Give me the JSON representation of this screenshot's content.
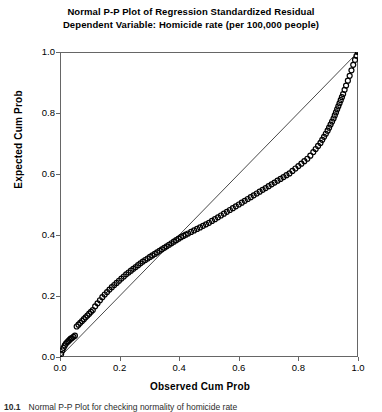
{
  "title": {
    "line1": "Normal P-P Plot of Regression Standardized Residual",
    "line2": "Dependent Variable: Homicide rate (per 100,000 people)"
  },
  "axes": {
    "xlabel": "Observed Cum Prob",
    "ylabel": "Expected Cum Prob",
    "xticks": [
      "0.0",
      "0.2",
      "0.4",
      "0.6",
      "0.8",
      "1.0"
    ],
    "yticks": [
      "0.0",
      "0.2",
      "0.4",
      "0.6",
      "0.8",
      "1.0"
    ]
  },
  "caption": {
    "number": "10.1",
    "text": "Normal P-P Plot for checking normality of homicide rate"
  },
  "colors": {
    "marker": "#000000",
    "reference_line": "#1a1a1a",
    "frame": "#666666",
    "background": "#ffffff"
  },
  "chart_data": {
    "type": "scatter",
    "title": "Normal P-P Plot of Regression Standardized Residual",
    "subtitle": "Dependent Variable: Homicide rate (per 100,000 people)",
    "xlabel": "Observed Cum Prob",
    "ylabel": "Expected Cum Prob",
    "xlim": [
      0.0,
      1.0
    ],
    "ylim": [
      0.0,
      1.0
    ],
    "grid": false,
    "legend": false,
    "marker_style": "open-circle",
    "reference_line": {
      "label": "45-degree reference line",
      "from": [
        0.0,
        0.0
      ],
      "to": [
        1.0,
        1.0
      ]
    },
    "series": [
      {
        "name": "Observed vs Expected cumulative probability",
        "x": [
          0.004,
          0.008,
          0.012,
          0.016,
          0.02,
          0.024,
          0.028,
          0.032,
          0.036,
          0.04,
          0.045,
          0.05,
          0.056,
          0.062,
          0.068,
          0.074,
          0.08,
          0.086,
          0.092,
          0.098,
          0.104,
          0.11,
          0.118,
          0.126,
          0.134,
          0.142,
          0.15,
          0.158,
          0.166,
          0.174,
          0.182,
          0.19,
          0.198,
          0.206,
          0.214,
          0.222,
          0.23,
          0.238,
          0.246,
          0.254,
          0.262,
          0.27,
          0.278,
          0.286,
          0.294,
          0.302,
          0.31,
          0.318,
          0.326,
          0.334,
          0.342,
          0.35,
          0.358,
          0.366,
          0.374,
          0.382,
          0.39,
          0.398,
          0.406,
          0.414,
          0.422,
          0.43,
          0.44,
          0.45,
          0.46,
          0.47,
          0.48,
          0.49,
          0.5,
          0.51,
          0.52,
          0.53,
          0.54,
          0.55,
          0.56,
          0.57,
          0.58,
          0.59,
          0.6,
          0.61,
          0.62,
          0.63,
          0.64,
          0.65,
          0.66,
          0.67,
          0.68,
          0.69,
          0.7,
          0.71,
          0.72,
          0.73,
          0.74,
          0.75,
          0.76,
          0.77,
          0.78,
          0.79,
          0.8,
          0.81,
          0.82,
          0.83,
          0.84,
          0.85,
          0.858,
          0.866,
          0.874,
          0.88,
          0.886,
          0.892,
          0.898,
          0.903,
          0.908,
          0.913,
          0.918,
          0.922,
          0.926,
          0.93,
          0.934,
          0.938,
          0.942,
          0.946,
          0.95,
          0.955,
          0.96,
          0.966,
          0.972,
          0.978,
          0.984,
          0.99,
          0.995,
          1.0
        ],
        "y": [
          0.01,
          0.022,
          0.03,
          0.038,
          0.044,
          0.048,
          0.052,
          0.056,
          0.06,
          0.062,
          0.066,
          0.07,
          0.1,
          0.106,
          0.112,
          0.118,
          0.124,
          0.13,
          0.136,
          0.142,
          0.148,
          0.154,
          0.166,
          0.176,
          0.186,
          0.196,
          0.205,
          0.213,
          0.221,
          0.229,
          0.236,
          0.243,
          0.25,
          0.257,
          0.264,
          0.271,
          0.277,
          0.283,
          0.289,
          0.295,
          0.301,
          0.307,
          0.313,
          0.318,
          0.323,
          0.328,
          0.333,
          0.338,
          0.343,
          0.348,
          0.353,
          0.358,
          0.363,
          0.368,
          0.373,
          0.378,
          0.383,
          0.388,
          0.393,
          0.397,
          0.401,
          0.405,
          0.41,
          0.415,
          0.42,
          0.425,
          0.43,
          0.435,
          0.44,
          0.446,
          0.452,
          0.458,
          0.464,
          0.47,
          0.476,
          0.482,
          0.488,
          0.494,
          0.5,
          0.506,
          0.512,
          0.518,
          0.524,
          0.53,
          0.536,
          0.542,
          0.548,
          0.554,
          0.56,
          0.566,
          0.572,
          0.578,
          0.584,
          0.59,
          0.596,
          0.602,
          0.61,
          0.618,
          0.626,
          0.634,
          0.642,
          0.65,
          0.66,
          0.672,
          0.682,
          0.692,
          0.702,
          0.712,
          0.722,
          0.732,
          0.742,
          0.752,
          0.762,
          0.772,
          0.782,
          0.792,
          0.802,
          0.812,
          0.822,
          0.832,
          0.842,
          0.852,
          0.862,
          0.876,
          0.89,
          0.906,
          0.922,
          0.94,
          0.958,
          0.974,
          0.988,
          1.0
        ]
      }
    ]
  }
}
